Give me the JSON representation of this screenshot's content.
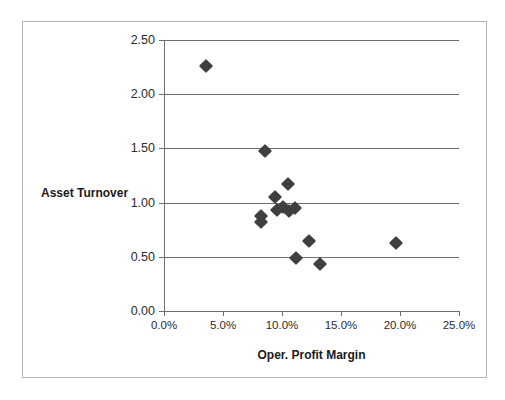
{
  "chart_data": {
    "type": "scatter",
    "title": "",
    "xlabel": "Oper. Profit Margin",
    "ylabel": "Asset Turnover",
    "xlim": [
      0,
      25
    ],
    "ylim": [
      0,
      2.5
    ],
    "xtick_labels": [
      "0.0%",
      "5.0%",
      "10.0%",
      "15.0%",
      "20.0%",
      "25.0%"
    ],
    "xtick_values": [
      0,
      5,
      10,
      15,
      20,
      25
    ],
    "ytick_labels": [
      "0.00",
      "0.50",
      "1.00",
      "1.50",
      "2.00",
      "2.50"
    ],
    "ytick_values": [
      0,
      0.5,
      1.0,
      1.5,
      2.0,
      2.5
    ],
    "grid": "horizontal",
    "legend": "none",
    "marker": "diamond",
    "marker_color": "#3f3f3f",
    "series": [
      {
        "name": "Companies",
        "points": [
          {
            "x": 3.6,
            "y": 2.26
          },
          {
            "x": 8.6,
            "y": 1.48
          },
          {
            "x": 10.5,
            "y": 1.17
          },
          {
            "x": 9.4,
            "y": 1.05
          },
          {
            "x": 10.1,
            "y": 0.96
          },
          {
            "x": 11.1,
            "y": 0.95
          },
          {
            "x": 10.6,
            "y": 0.92
          },
          {
            "x": 9.6,
            "y": 0.93
          },
          {
            "x": 8.2,
            "y": 0.88
          },
          {
            "x": 8.2,
            "y": 0.82
          },
          {
            "x": 12.3,
            "y": 0.65
          },
          {
            "x": 19.7,
            "y": 0.63
          },
          {
            "x": 11.2,
            "y": 0.49
          },
          {
            "x": 13.2,
            "y": 0.43
          }
        ]
      }
    ]
  },
  "colors": {
    "frame_border": "#b5b5b5",
    "axis": "#6e6e6e",
    "marker": "#3f3f3f",
    "text": "#1a1a1a"
  }
}
